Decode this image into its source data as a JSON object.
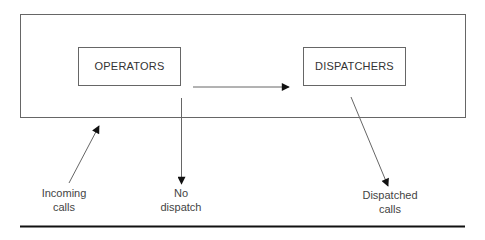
{
  "nodes": {
    "operators": {
      "label": "OPERATORS"
    },
    "dispatchers": {
      "label": "DISPATCHERS"
    }
  },
  "captions": {
    "incoming": {
      "line1": "Incoming",
      "line2": "calls"
    },
    "no_dispatch": {
      "line1": "No",
      "line2": "dispatch"
    },
    "dispatched": {
      "line1": "Dispatched",
      "line2": "calls"
    }
  },
  "edges": [
    {
      "from": "external",
      "to": "system",
      "label": "Incoming calls"
    },
    {
      "from": "operators",
      "to": "dispatchers",
      "label": ""
    },
    {
      "from": "operators",
      "to": "external",
      "label": "No dispatch"
    },
    {
      "from": "dispatchers",
      "to": "external",
      "label": "Dispatched calls"
    }
  ],
  "colors": {
    "line": "#555555",
    "arrow": "#111111",
    "rule": "#111111"
  }
}
